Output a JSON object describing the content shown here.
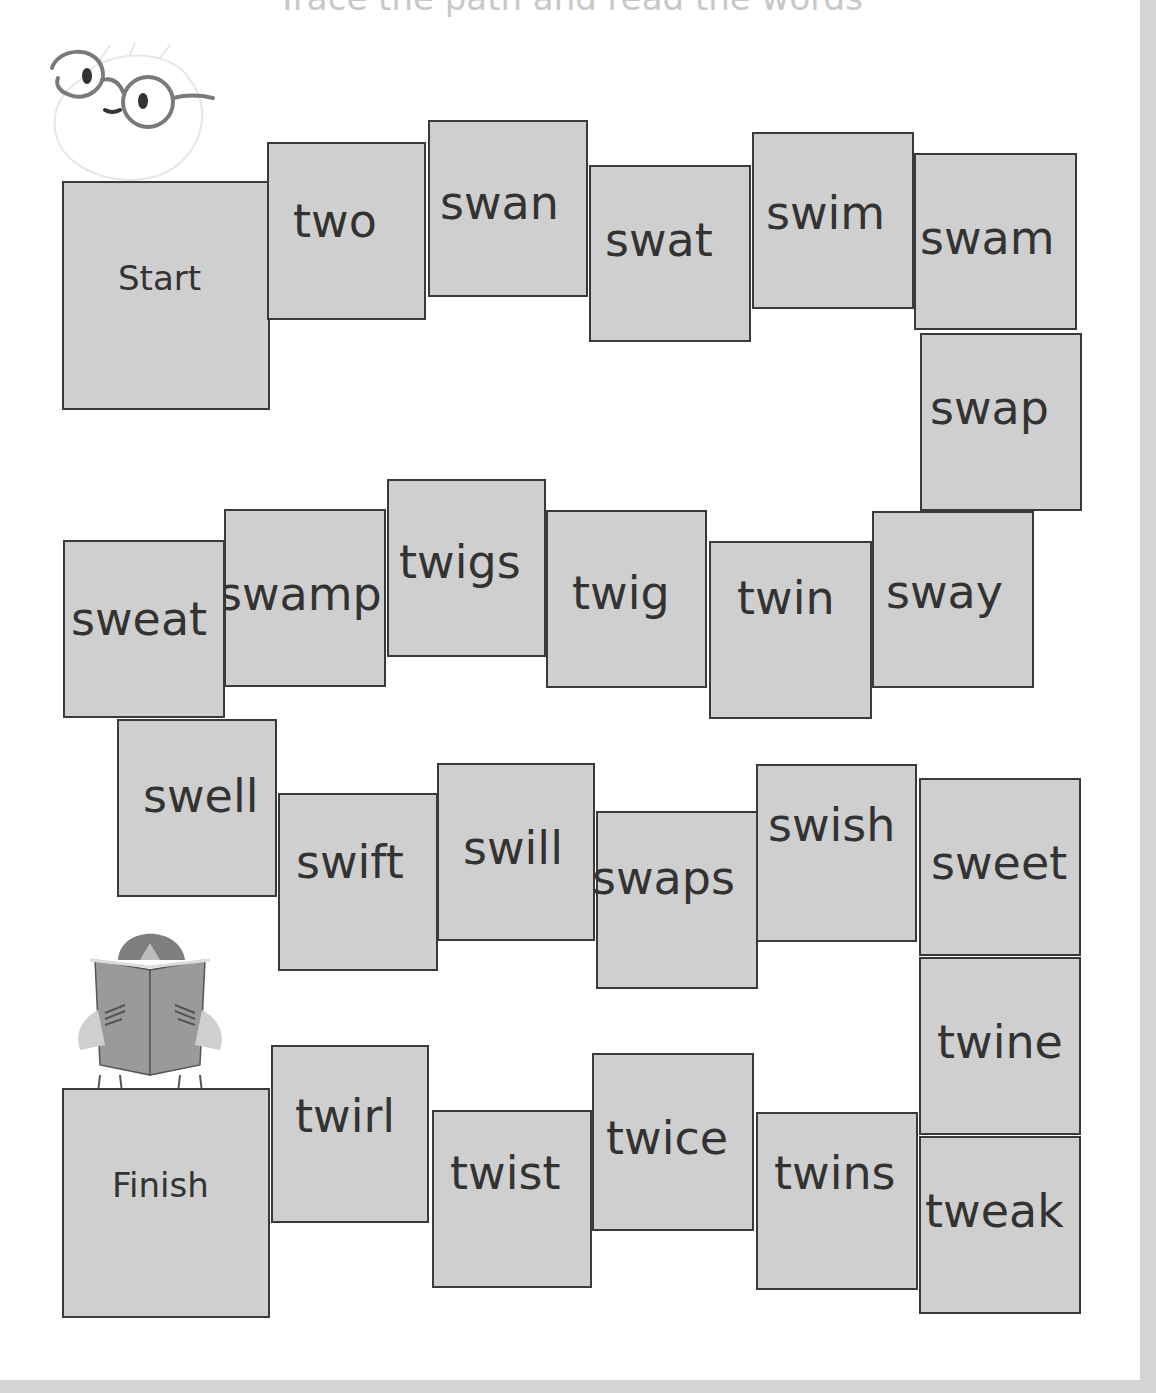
{
  "title": "Trace the path and read the words",
  "board": {
    "start_label": "Start",
    "finish_label": "Finish",
    "tiles": [
      {
        "word": "Start",
        "x": 62,
        "y": 181,
        "w": 208,
        "h": 229,
        "tx": 54,
        "ty": 98,
        "size": "small"
      },
      {
        "word": "two",
        "x": 267,
        "y": 142,
        "w": 159,
        "h": 178,
        "tx": 24,
        "ty": 74
      },
      {
        "word": "swan",
        "x": 428,
        "y": 120,
        "w": 160,
        "h": 177,
        "tx": 10,
        "ty": 78
      },
      {
        "word": "swat",
        "x": 589,
        "y": 165,
        "w": 162,
        "h": 177,
        "tx": 14,
        "ty": 70
      },
      {
        "word": "swim",
        "x": 752,
        "y": 132,
        "w": 162,
        "h": 177,
        "tx": 12,
        "ty": 76
      },
      {
        "word": "swam",
        "x": 914,
        "y": 153,
        "w": 163,
        "h": 177,
        "tx": 4,
        "ty": 80
      },
      {
        "word": "swap",
        "x": 920,
        "y": 333,
        "w": 162,
        "h": 178,
        "tx": 8,
        "ty": 70
      },
      {
        "word": "sway",
        "x": 872,
        "y": 511,
        "w": 162,
        "h": 177,
        "tx": 12,
        "ty": 76
      },
      {
        "word": "twin",
        "x": 709,
        "y": 541,
        "w": 163,
        "h": 178,
        "tx": 26,
        "ty": 52
      },
      {
        "word": "twig",
        "x": 546,
        "y": 510,
        "w": 161,
        "h": 178,
        "tx": 24,
        "ty": 78
      },
      {
        "word": "twigs",
        "x": 387,
        "y": 479,
        "w": 159,
        "h": 178,
        "tx": 10,
        "ty": 78
      },
      {
        "word": "swamp",
        "x": 224,
        "y": 509,
        "w": 162,
        "h": 178,
        "tx": -8,
        "ty": 80
      },
      {
        "word": "sweat",
        "x": 63,
        "y": 540,
        "w": 162,
        "h": 178,
        "tx": 6,
        "ty": 74
      },
      {
        "word": "swell",
        "x": 117,
        "y": 719,
        "w": 160,
        "h": 178,
        "tx": 24,
        "ty": 72
      },
      {
        "word": "swift",
        "x": 278,
        "y": 793,
        "w": 160,
        "h": 178,
        "tx": 16,
        "ty": 64
      },
      {
        "word": "swill",
        "x": 437,
        "y": 763,
        "w": 158,
        "h": 178,
        "tx": 24,
        "ty": 80
      },
      {
        "word": "swaps",
        "x": 596,
        "y": 811,
        "w": 162,
        "h": 178,
        "tx": -6,
        "ty": 62
      },
      {
        "word": "swish",
        "x": 756,
        "y": 764,
        "w": 161,
        "h": 178,
        "tx": 10,
        "ty": 56
      },
      {
        "word": "sweet",
        "x": 919,
        "y": 778,
        "w": 162,
        "h": 178,
        "tx": 10,
        "ty": 80
      },
      {
        "word": "twine",
        "x": 919,
        "y": 957,
        "w": 162,
        "h": 178,
        "tx": 16,
        "ty": 80
      },
      {
        "word": "tweak",
        "x": 919,
        "y": 1136,
        "w": 162,
        "h": 178,
        "tx": 4,
        "ty": 70
      },
      {
        "word": "twins",
        "x": 756,
        "y": 1112,
        "w": 162,
        "h": 178,
        "tx": 16,
        "ty": 56
      },
      {
        "word": "twice",
        "x": 592,
        "y": 1053,
        "w": 162,
        "h": 178,
        "tx": 12,
        "ty": 80
      },
      {
        "word": "twist",
        "x": 432,
        "y": 1110,
        "w": 160,
        "h": 178,
        "tx": 16,
        "ty": 58
      },
      {
        "word": "twirl",
        "x": 271,
        "y": 1045,
        "w": 158,
        "h": 178,
        "tx": 22,
        "ty": 66
      },
      {
        "word": "Finish",
        "x": 62,
        "y": 1088,
        "w": 208,
        "h": 230,
        "tx": 48,
        "ty": 98,
        "size": "small"
      }
    ]
  },
  "illustrations": {
    "top_left": "mascot-with-glasses",
    "bottom_left": "child-reading-book"
  },
  "colors": {
    "tile_fill": "#cfcfcf",
    "tile_border": "#3a3a3a",
    "text": "#333333",
    "page_border": "#d4d4d4"
  }
}
